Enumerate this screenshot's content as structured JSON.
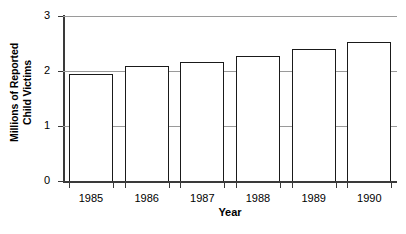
{
  "chart_data": {
    "type": "bar",
    "title": "",
    "subtitle": "",
    "xlabel": "Year",
    "ylabel_line1": "Millions of Reported",
    "ylabel_line2": "Child Victims",
    "ylabel": "Millions of Reported Child Victims",
    "categories": [
      "1985",
      "1986",
      "1987",
      "1988",
      "1989",
      "1990"
    ],
    "values": [
      1.95,
      2.1,
      2.17,
      2.28,
      2.4,
      2.52
    ],
    "series": [
      {
        "name": "Millions of Reported Child Victims",
        "values": [
          1.95,
          2.1,
          2.17,
          2.28,
          2.4,
          2.52
        ]
      }
    ],
    "ylim": [
      0,
      3
    ],
    "yticks": [
      0,
      1,
      2,
      3
    ],
    "ytick_labels": [
      "0",
      "1",
      "2",
      "3"
    ],
    "xtick_labels": [
      "1985",
      "1986",
      "1987",
      "1988",
      "1989",
      "1990"
    ],
    "grid": true,
    "grid_axis": "y",
    "legend": false,
    "legend_position": "none",
    "bar_fill_color": "#ffffff",
    "bar_edge_color": "#1a1a1a",
    "gridline_color": "#9a9a9a",
    "axis_color": "#3a3a3a",
    "background_color": "#ffffff"
  }
}
